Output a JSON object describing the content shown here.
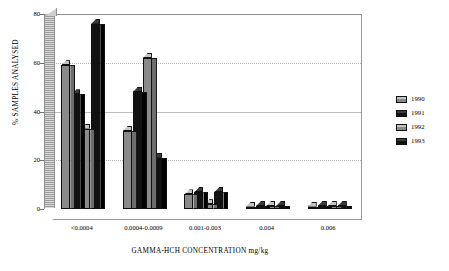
{
  "chart_data": {
    "type": "bar",
    "title": "",
    "xlabel": "GAMMA-HCH CONCENTRATION mg/kg",
    "ylabel": "% SAMPLES ANALYSED",
    "categories": [
      "<0.0004",
      "0.0004-0.0009",
      "0.001-0.003",
      "0.004",
      "0.006"
    ],
    "series": [
      {
        "name": "1990",
        "color": "#8a8a8a",
        "values": [
          59,
          32,
          6,
          0,
          0
        ]
      },
      {
        "name": "1991",
        "color": "#121212",
        "values": [
          47,
          48,
          7,
          1,
          1
        ]
      },
      {
        "name": "1992",
        "color": "#8a8a8a",
        "values": [
          33,
          62,
          2,
          1,
          1
        ]
      },
      {
        "name": "1993",
        "color": "#121212",
        "values": [
          76,
          21,
          7,
          1,
          1
        ]
      }
    ],
    "ylim": [
      0,
      80
    ],
    "yticks": [
      0,
      20,
      40,
      60,
      80
    ],
    "ytick_labels": [
      "0",
      "20",
      "40",
      "60",
      "80"
    ],
    "grid": true,
    "legend_position": "right",
    "style": "3d-clustered-column"
  },
  "legend": {
    "items": [
      {
        "label": "1990",
        "swatch": "gray"
      },
      {
        "label": "1991",
        "swatch": "black"
      },
      {
        "label": "1992",
        "swatch": "gray"
      },
      {
        "label": "1993",
        "swatch": "black"
      }
    ]
  }
}
